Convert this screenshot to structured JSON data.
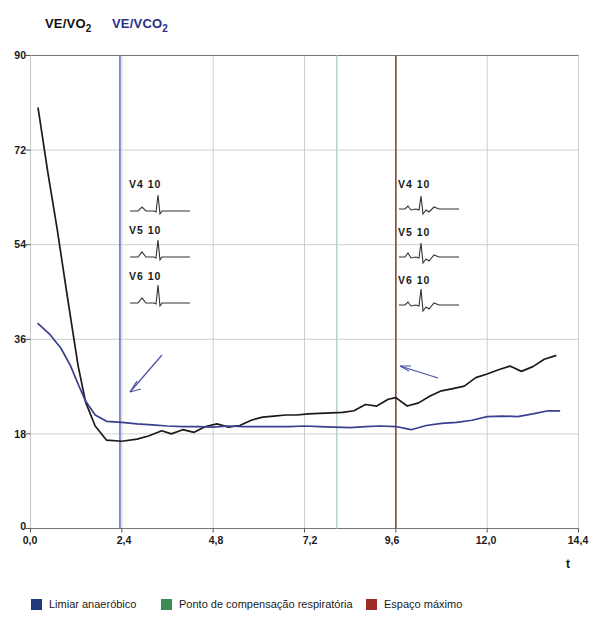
{
  "header": {
    "series_black_label": "VE/VO",
    "series_black_sub": "2",
    "series_blue_label": "VE/VCO",
    "series_blue_sub": "2"
  },
  "colors": {
    "curve_black": "#1a1a1a",
    "curve_blue": "#3a3f8f",
    "marker_anaerobic": "#6a74c9",
    "marker_respiratory": "#bcd6c3",
    "marker_max": "#8c4a44",
    "legend_blue": "#1f3a7a",
    "legend_green": "#3d8c55",
    "legend_red": "#9b2b28",
    "grid": "#c9c9c9",
    "axis": "#555555"
  },
  "legend": {
    "items": [
      {
        "label": "Limiar anaeróbico",
        "color": "#1f3a7a"
      },
      {
        "label": "Ponto de compensação respiratória",
        "color": "#3d8c55"
      },
      {
        "label": "Espaço máximo",
        "color": "#9b2b28"
      }
    ]
  },
  "ecg_left": {
    "arrow": "arrow-down-left",
    "items": [
      {
        "lead": "V4  10"
      },
      {
        "lead": "V5  10"
      },
      {
        "lead": "V6  10"
      }
    ]
  },
  "ecg_right": {
    "arrow": "arrow-left",
    "items": [
      {
        "lead": "V4  10"
      },
      {
        "lead": "V5  10"
      },
      {
        "lead": "V6  10"
      }
    ]
  },
  "axis_labels": {
    "y": [
      "90",
      "72",
      "54",
      "36",
      "18",
      "0"
    ],
    "x": [
      "0,0",
      "2,4",
      "4,8",
      "7,2",
      "9,6",
      "12,0",
      "14,4"
    ],
    "x_title": "t"
  },
  "chart_data": {
    "type": "line",
    "title": "",
    "xlabel": "t",
    "ylabel": "",
    "xlim": [
      0.0,
      14.4
    ],
    "ylim": [
      0,
      90
    ],
    "xticks": [
      0.0,
      2.4,
      4.8,
      7.2,
      9.6,
      12.0,
      14.4
    ],
    "yticks": [
      0,
      18,
      36,
      54,
      72,
      90
    ],
    "grid": true,
    "legend_position": "below-axes",
    "vertical_markers": [
      {
        "name": "Limiar anaeróbico",
        "x": 2.35,
        "color": "#6a74c9"
      },
      {
        "name": "Ponto de compensação respiratória",
        "x": 8.05,
        "color": "#bcd6c3"
      },
      {
        "name": "Espaço máximo",
        "x": 9.6,
        "color": "#8c4a44"
      }
    ],
    "series": [
      {
        "name": "VE/VO2",
        "color": "#1a1a1a",
        "x": [
          0.2,
          0.45,
          0.7,
          0.95,
          1.1,
          1.25,
          1.45,
          1.7,
          2.0,
          2.4,
          2.8,
          3.1,
          3.45,
          3.7,
          4.0,
          4.3,
          4.6,
          4.9,
          5.2,
          5.5,
          5.8,
          6.1,
          6.4,
          6.7,
          7.0,
          7.3,
          7.6,
          7.9,
          8.2,
          8.5,
          8.8,
          9.1,
          9.4,
          9.6,
          9.9,
          10.2,
          10.5,
          10.8,
          11.1,
          11.4,
          11.7,
          12.0,
          12.3,
          12.6,
          12.9,
          13.2,
          13.5,
          13.8
        ],
        "y": [
          80.0,
          68.0,
          57.0,
          45.0,
          38.0,
          31.0,
          24.0,
          19.5,
          16.8,
          16.6,
          17.0,
          17.6,
          18.6,
          18.0,
          18.8,
          18.3,
          19.4,
          19.9,
          19.3,
          19.6,
          20.6,
          21.2,
          21.4,
          21.6,
          21.6,
          21.8,
          21.9,
          22.0,
          22.1,
          22.4,
          23.6,
          23.3,
          24.6,
          24.9,
          23.3,
          23.9,
          25.2,
          26.2,
          26.6,
          27.1,
          28.7,
          29.4,
          30.2,
          30.9,
          29.9,
          30.8,
          32.2,
          32.9
        ]
      },
      {
        "name": "VE/VCO2",
        "color": "#3a3f8f",
        "x": [
          0.2,
          0.5,
          0.8,
          1.05,
          1.25,
          1.45,
          1.7,
          2.0,
          2.4,
          2.8,
          3.2,
          3.6,
          4.0,
          4.4,
          4.8,
          5.2,
          5.6,
          6.0,
          6.4,
          6.8,
          7.2,
          7.6,
          8.0,
          8.4,
          8.8,
          9.2,
          9.6,
          10.0,
          10.4,
          10.8,
          11.2,
          11.6,
          12.0,
          12.4,
          12.8,
          13.2,
          13.6,
          13.9
        ],
        "y": [
          39.0,
          37.0,
          34.3,
          31.0,
          27.5,
          24.2,
          21.6,
          20.4,
          20.2,
          19.9,
          19.7,
          19.5,
          19.4,
          19.4,
          19.3,
          19.5,
          19.4,
          19.4,
          19.4,
          19.4,
          19.5,
          19.4,
          19.3,
          19.2,
          19.4,
          19.5,
          19.4,
          18.8,
          19.6,
          20.0,
          20.2,
          20.6,
          21.3,
          21.4,
          21.3,
          21.8,
          22.4,
          22.4
        ]
      }
    ]
  }
}
